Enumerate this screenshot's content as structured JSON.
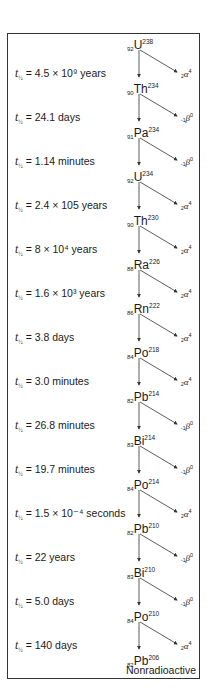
{
  "diagram": {
    "footer_label": "Nonradioactive",
    "half_life_prefix": "t",
    "half_life_subscript": "½",
    "nuclides": [
      {
        "z": "92",
        "symbol": "U",
        "a": "238"
      },
      {
        "z": "90",
        "symbol": "Th",
        "a": "234"
      },
      {
        "z": "91",
        "symbol": "Pa",
        "a": "234"
      },
      {
        "z": "92",
        "symbol": "U",
        "a": "234"
      },
      {
        "z": "90",
        "symbol": "Th",
        "a": "230"
      },
      {
        "z": "88",
        "symbol": "Ra",
        "a": "226"
      },
      {
        "z": "86",
        "symbol": "Rn",
        "a": "222"
      },
      {
        "z": "84",
        "symbol": "Po",
        "a": "218"
      },
      {
        "z": "82",
        "symbol": "Pb",
        "a": "214"
      },
      {
        "z": "83",
        "symbol": "Bi",
        "a": "214"
      },
      {
        "z": "84",
        "symbol": "Po",
        "a": "214"
      },
      {
        "z": "82",
        "symbol": "Pb",
        "a": "210"
      },
      {
        "z": "83",
        "symbol": "Bi",
        "a": "210"
      },
      {
        "z": "84",
        "symbol": "Po",
        "a": "210"
      },
      {
        "z": "82",
        "symbol": "Pb",
        "a": "206"
      }
    ],
    "steps": [
      {
        "half_life": "= 4.5 × 10⁹ years",
        "particle": {
          "z": "2",
          "symbol": "α",
          "a": "4"
        }
      },
      {
        "half_life": "= 24.1 days",
        "particle": {
          "z": "-1",
          "symbol": "β",
          "a": "0"
        }
      },
      {
        "half_life": "= 1.14 minutes",
        "particle": {
          "z": "-1",
          "symbol": "β",
          "a": "0"
        }
      },
      {
        "half_life": "= 2.4 × 105 years",
        "particle": {
          "z": "2",
          "symbol": "α",
          "a": "4"
        }
      },
      {
        "half_life": "= 8 × 10⁴ years",
        "particle": {
          "z": "2",
          "symbol": "α",
          "a": "4"
        }
      },
      {
        "half_life": "= 1.6 × 10³ years",
        "particle": {
          "z": "2",
          "symbol": "α",
          "a": "4"
        }
      },
      {
        "half_life": "= 3.8 days",
        "particle": {
          "z": "2",
          "symbol": "α",
          "a": "4"
        }
      },
      {
        "half_life": "= 3.0 minutes",
        "particle": {
          "z": "2",
          "symbol": "α",
          "a": "4"
        }
      },
      {
        "half_life": "= 26.8 minutes",
        "particle": {
          "z": "-1",
          "symbol": "β",
          "a": "0"
        }
      },
      {
        "half_life": "= 19.7 minutes",
        "particle": {
          "z": "-1",
          "symbol": "β",
          "a": "0"
        }
      },
      {
        "half_life": "= 1.5 × 10⁻⁴ seconds",
        "particle": {
          "z": "2",
          "symbol": "α",
          "a": "4"
        }
      },
      {
        "half_life": "= 22 years",
        "particle": {
          "z": "-1",
          "symbol": "β",
          "a": "0"
        }
      },
      {
        "half_life": "= 5.0 days",
        "particle": {
          "z": "-1",
          "symbol": "β",
          "a": "0"
        }
      },
      {
        "half_life": "= 140 days",
        "particle": {
          "z": "2",
          "symbol": "α",
          "a": "4"
        }
      }
    ]
  }
}
